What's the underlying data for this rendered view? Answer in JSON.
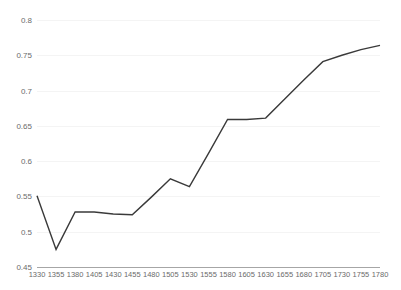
{
  "chart_data": {
    "type": "line",
    "title": "",
    "subtitle": "",
    "xlabel": "",
    "ylabel": "",
    "grid": true,
    "legend": false,
    "legend_position": "none",
    "line_color": "#3a3a3a",
    "grid_color": "#f4f4f4",
    "axis_color": "#a6a6a6",
    "tick_label_color": "#6b6b6b",
    "xlim": [
      1330,
      1780
    ],
    "ylim": [
      0.45,
      0.8
    ],
    "x_tick_labels": [
      "1330",
      "1355",
      "1380",
      "1405",
      "1430",
      "1455",
      "1480",
      "1505",
      "1530",
      "1555",
      "1580",
      "1605",
      "1630",
      "1655",
      "1680",
      "1705",
      "1730",
      "1755",
      "1780"
    ],
    "y_tick_labels": [
      "0.8",
      "0.75",
      "0.7",
      "0.65",
      "0.6",
      "0.55",
      "0.5",
      "0.45"
    ],
    "y_tick_values": [
      0.8,
      0.75,
      0.7,
      0.65,
      0.6,
      0.55,
      0.5,
      0.45
    ],
    "categories": [
      1330,
      1355,
      1380,
      1405,
      1430,
      1455,
      1480,
      1505,
      1530,
      1555,
      1580,
      1605,
      1630,
      1655,
      1680,
      1705,
      1730,
      1755,
      1780
    ],
    "values": [
      0.551,
      0.475,
      0.528,
      0.528,
      0.525,
      0.524,
      0.549,
      0.575,
      0.564,
      0.611,
      0.659,
      0.659,
      0.661,
      0.688,
      0.715,
      0.741,
      0.75,
      0.758,
      0.764
    ],
    "series": [
      {
        "name": "series-1",
        "color": "#3a3a3a",
        "values": [
          0.551,
          0.475,
          0.528,
          0.528,
          0.525,
          0.524,
          0.549,
          0.575,
          0.564,
          0.611,
          0.659,
          0.659,
          0.661,
          0.688,
          0.715,
          0.741,
          0.75,
          0.758,
          0.764
        ]
      }
    ]
  }
}
